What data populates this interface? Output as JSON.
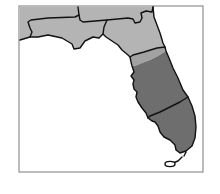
{
  "map": {
    "type": "choropleth",
    "subject": "Florida regions",
    "frame": {
      "x": 19,
      "y": 6,
      "width": 184,
      "height": 166,
      "stroke": "#8f8f8f"
    },
    "colors": {
      "light": "#b4b4b4",
      "transition": "#a2a2a2",
      "dark": "#6e6e6e",
      "water": "#ffffff",
      "border": "#111111"
    },
    "regions": [
      {
        "id": "northwest-panhandle",
        "shade": "light",
        "path": "M20,7 L78,7 L79,15 L75,17 L48,18 L31,20 L28,22 L30,28 L32,32 L30,37 L20,40 Z"
      },
      {
        "id": "west-panhandle",
        "shade": "light",
        "path": "M78,7 L153,7 L152,12 L146,11 L141,13 L142,18 L140,22 L135,23 L133,19 L128,18 L107,20 L83,22 L80,20 L79,15 Z"
      },
      {
        "id": "central-panhandle",
        "shade": "light",
        "path": "M31,20 L48,18 L75,17 L79,15 L80,20 L83,22 L107,20 L104,27 L103,34 L99,38 L93,37 L85,41 L80,48 L74,49 L72,44 L62,38 L48,35 L38,37 L30,37 L32,32 L30,28 L28,22 Z"
      },
      {
        "id": "north-central",
        "shade": "light",
        "path": "M107,20 L128,18 L133,19 L135,23 L140,22 L142,18 L141,13 L146,11 L152,12 L153,7 L154,17 L157,25 L160,33 L163,43 L165,47 L157,48 L144,52 L133,55 L130,57 L128,55 L122,50 L118,45 L112,41 L106,37 L103,34 L104,27 Z"
      },
      {
        "id": "transition-strip",
        "shade": "transition",
        "path": "M130,57 L133,55 L144,52 L157,48 L165,47 L166,51 L158,56 L150,60 L142,63 L135,66 L132,66 L131,62 Z"
      },
      {
        "id": "central",
        "shade": "dark",
        "path": "M132,66 L135,66 L142,63 L150,60 L158,56 L166,51 L169,58 L173,68 L178,78 L183,90 L188,97 L180,102 L170,107 L160,112 L150,116 L148,118 L146,113 L142,108 L138,102 L136,97 L137,92 L134,89 L133,84 L134,80 L131,76 L134,72 Z"
      },
      {
        "id": "south",
        "shade": "dark",
        "path": "M148,118 L150,116 L160,112 L170,107 L180,102 L188,97 L192,106 L195,116 L196,127 L195,138 L192,146 L186,151 L180,153 L176,150 L175,145 L170,140 L164,137 L160,132 L158,126 L155,122 L152,121 Z"
      }
    ],
    "borders": [
      "M20,40 L30,37 L38,37 L48,35 L62,38 L72,44 L74,49 L80,48 L85,41 L93,37 L99,38 L103,34 L106,37 L112,41 L118,45 L122,50 L128,55 L130,57 L131,62 L132,66 L134,72 L131,76 L134,80 L133,84 L134,89 L137,92 L136,97 L138,102 L142,108 L146,113 L148,118 L152,121 L155,122 L158,126 L160,132 L164,137 L170,140 L175,145 L176,150 L180,153 L186,151 L192,146 L195,138 L196,127 L195,116 L192,106 L188,97 L183,90 L178,78 L173,68 L169,58 L166,51 L165,47 L163,43 L160,33 L157,25 L154,17 L153,7",
      "M78,7 L79,15 L75,17 L48,18 L31,20 L28,22 L30,28 L32,32 L30,37",
      "M79,15 L80,20 L83,22 L107,20 L128,18 L133,19 L135,23 L140,22 L142,18 L141,13 L146,11 L152,12 L153,7",
      "M107,20 L104,27 L103,34",
      "M130,57 L133,55 L144,52 L157,48 L165,47",
      "M148,118 L150,116 L160,112 L170,107 L180,102 L188,97",
      "M182,157 L178,161 L173,163",
      "M186,152 L184,156"
    ],
    "keys_island": {
      "cx": 170,
      "cy": 164,
      "rx": 5,
      "ry": 2.6
    }
  }
}
